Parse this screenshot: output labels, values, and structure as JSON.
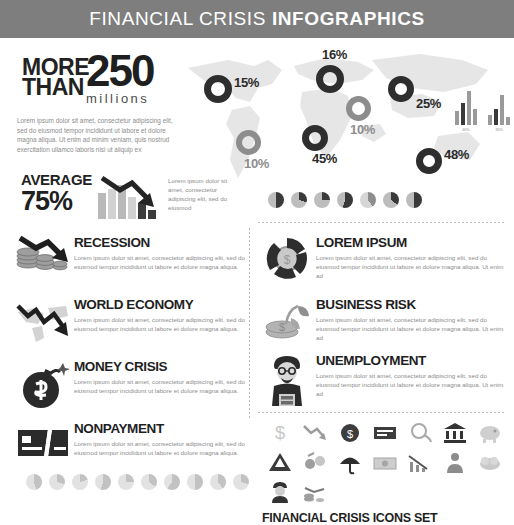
{
  "header": {
    "title_light": "FINANCIAL CRISIS ",
    "title_bold": "INFOGRAPHICS"
  },
  "hero": {
    "more": "MORE",
    "than": "THAN",
    "number": "250",
    "unit": "millions",
    "lead_text": "Lorem ipsum dolor sit amet, consectetur adipiscing elit, sed do eiusmod tempor incididunt ut labore et dolore magna aliqua. Ut enim ad minim veniam, quis nostrud exercitation ullamco laboris nisi ut aliquip ex"
  },
  "average": {
    "label": "AVERAGE",
    "value": "75%",
    "text": "Lorem ipsum dolor sit amet, consectetur adipiscing elit, sed do eiusmod",
    "bars": [
      26,
      30,
      34,
      22,
      16,
      9
    ]
  },
  "map": {
    "markers": [
      {
        "label": "15%",
        "tone": "dark",
        "x": 28,
        "y": 35,
        "size": 28
      },
      {
        "label": "16%",
        "tone": "dark",
        "x": 140,
        "y": 25,
        "size": 28
      },
      {
        "label": "25%",
        "tone": "dark",
        "x": 212,
        "y": 36,
        "size": 26
      },
      {
        "label": "10%",
        "tone": "mid",
        "x": 170,
        "y": 56,
        "size": 25
      },
      {
        "label": "10%",
        "tone": "mid",
        "x": 60,
        "y": 90,
        "size": 25
      },
      {
        "label": "45%",
        "tone": "dark",
        "x": 126,
        "y": 85,
        "size": 26
      },
      {
        "label": "48%",
        "tone": "dark",
        "x": 240,
        "y": 108,
        "size": 26
      }
    ],
    "mini_charts": [
      {
        "bars": [
          14,
          22,
          34,
          16
        ],
        "caption": "40%"
      },
      {
        "bars": [
          10,
          16,
          30,
          8
        ],
        "caption": "35%"
      }
    ]
  },
  "left_items": [
    {
      "title": "RECESSION",
      "icon": "coins-down-arrow-icon",
      "desc": "Lorem ipsum dolor sit amet, consectetur adipiscing elit, sed do eiusmod tempor incididunt ut labore et dolore magna aliqua."
    },
    {
      "title": "WORLD ECONOMY",
      "icon": "world-map-down-arrow-icon",
      "desc": "Lorem ipsum dolor sit amet, consectetur adipiscing elit, sed do eiusmod tempor incididunt ut labore et dolore magna aliqua."
    },
    {
      "title": "MONEY CRISIS",
      "icon": "dollar-bomb-icon",
      "desc": "Lorem ipsum dolor sit amet, consectetur adipiscing elit, sed do eiusmod tempor incididunt ut labore et dolore magna aliqua."
    },
    {
      "title": "NONPAYMENT",
      "icon": "cut-credit-card-icon",
      "desc": "Lorem ipsum dolor sit amet, consectetur adipiscing elit, sed do eiusmod tempor incididunt ut labore et dolore magna aliqua."
    }
  ],
  "right_items": [
    {
      "title": "LOREM IPSUM",
      "icon": "coin-donut-icon",
      "desc": "Lorem ipsum dolor sit amet, consectetur adipiscing elit, sed do eiusmod tempor incididunt ut labore et dolore magna aliqua. Ut enim ad"
    },
    {
      "title": "BUSINESS RISK",
      "icon": "coin-sprout-icon",
      "desc": "Lorem ipsum dolor sit amet, consectetur adipiscing elit, sed do eiusmod tempor incididunt ut labore et dolore magna aliqua. Ut enim ad"
    },
    {
      "title": "UNEMPLOYMENT",
      "icon": "jobless-man-sign-icon",
      "desc": "Lorem ipsum dolor sit amet, consectetur adipiscing elit, sed do eiusmod tempor incididunt ut labore et dolore magna aliqua. Ut enim ad"
    }
  ],
  "pie_row_top": [
    {
      "value": 50,
      "tone": "dark"
    },
    {
      "value": 30,
      "tone": "dark"
    },
    {
      "value": 25,
      "tone": "dark"
    },
    {
      "value": 55,
      "tone": "dark"
    },
    {
      "value": 40,
      "tone": "mid"
    },
    {
      "value": 35,
      "tone": "dark"
    },
    {
      "value": 50,
      "tone": "dark"
    }
  ],
  "pie_row_bottom": [
    {
      "value": 45,
      "tone": "light"
    },
    {
      "value": 30,
      "tone": "light"
    },
    {
      "value": 20,
      "tone": "light"
    },
    {
      "value": 55,
      "tone": "light"
    },
    {
      "value": 25,
      "tone": "light"
    },
    {
      "value": 35,
      "tone": "light"
    },
    {
      "value": 60,
      "tone": "light"
    },
    {
      "value": 50,
      "tone": "light"
    },
    {
      "value": 40,
      "tone": "light"
    },
    {
      "value": 30,
      "tone": "light"
    }
  ],
  "icon_set": {
    "title": "FINANCIAL CRISIS ICONS SET",
    "icons": [
      "dollar-sign-icon",
      "chart-down-arrow-icon",
      "dollar-coin-icon",
      "cash-stack-icon",
      "deflating-balloon-icon",
      "bank-building-icon",
      "piggy-bank-icon",
      "warning-mountain-icon",
      "coin-transfer-icon",
      "umbrella-icon",
      "banknote-icon",
      "falling-bar-chart-icon",
      "businessman-icon",
      "money-cloud-icon",
      "worker-icon",
      "declining-coins-icon"
    ]
  },
  "colors": {
    "header_bg": "#7e7e7e",
    "dark": "#2e2e2e",
    "mid": "#8d8d8d",
    "light": "#bdbdbd",
    "text_body": "#8c8c8c"
  }
}
